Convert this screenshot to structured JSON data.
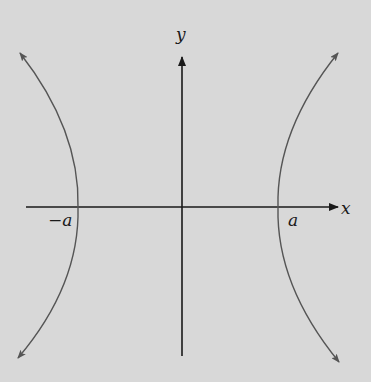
{
  "figure": {
    "type": "hyperbola",
    "background": "#d8d8d8",
    "axis_color": "#1a1a1a",
    "curve_color": "#555555"
  },
  "axes": {
    "x_label": "x",
    "y_label": "y"
  },
  "vertices": {
    "left_label": "−a",
    "right_label": "a"
  }
}
